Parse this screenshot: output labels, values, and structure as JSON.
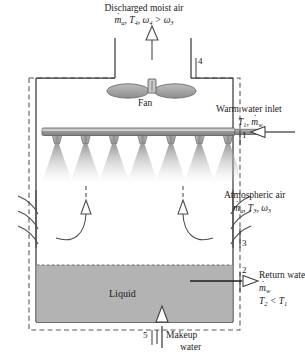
{
  "figure": {
    "type": "cooling-tower-schematic",
    "colors": {
      "line": "#3b3b3b",
      "liquid_fill": "#b3b3b3",
      "pipe_fill": "#9a9a9a",
      "spray": "#9e9e9e",
      "fan_blade": "#9d9d9d",
      "boundary_dash": "#5a5a5a"
    }
  },
  "labels": {
    "discharged_air": {
      "line1": "Discharged moist air",
      "mdot": "m",
      "sub_a": "a",
      "rest": ", T",
      "sub_4": "4",
      "omega": ", ω",
      "sub_4b": "4",
      "gt": " > ω",
      "sub_3": "3"
    },
    "fan": "Fan",
    "warm_water_inlet": {
      "line1": "Warm water inlet",
      "t": "T",
      "sub_1": "1",
      "comma": ", ",
      "mdot": "m",
      "sub_w": "w"
    },
    "atmospheric_air": {
      "line1": "Atmospheric air",
      "mdot": "m",
      "sub_a": "a",
      "rest": ", T",
      "sub_3": "3",
      "omega": ", ω",
      "sub_3b": "3"
    },
    "return_water": {
      "line1": "Return water",
      "mdot": "m",
      "sub_w": "w",
      "t2": "T",
      "sub_2": "2",
      "lt": " < T",
      "sub_1": "1"
    },
    "liquid": "Liquid",
    "makeup_water": {
      "line1": "Makeup",
      "line2": "water"
    }
  },
  "state_points": {
    "p1": "1",
    "p2": "2",
    "p3": "3",
    "p4": "4",
    "p5": "5"
  },
  "counts": {
    "nozzles": 7,
    "louver_slats_per_side": 3,
    "internal_flow_arrows": 2
  }
}
